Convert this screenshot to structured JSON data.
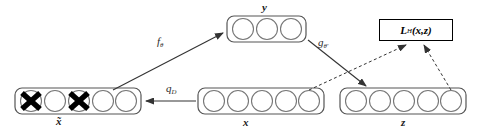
{
  "figure": {
    "type": "diagram",
    "colors": {
      "stroke": "#444444",
      "node_fill": "#ffffff",
      "cross": "#000000",
      "arrow": "#333333",
      "loss_border": "#000000",
      "background": "#ffffff"
    }
  },
  "layers": [
    {
      "id": "x-tilde",
      "label": "x̃",
      "label_plain": "x tilde",
      "units": 5,
      "corrupted_units": [
        1,
        3
      ],
      "corruption_marker": "cross",
      "box": {
        "x": 15,
        "y": 88,
        "w": 126,
        "h": 26
      }
    },
    {
      "id": "y",
      "label": "y",
      "label_plain": "y",
      "units": 3,
      "corrupted_units": [],
      "corruption_marker": "none",
      "box": {
        "x": 227,
        "y": 16,
        "w": 79,
        "h": 26
      }
    },
    {
      "id": "x",
      "label": "x",
      "label_plain": "x",
      "units": 5,
      "corrupted_units": [],
      "corruption_marker": "none",
      "box": {
        "x": 198,
        "y": 88,
        "w": 126,
        "h": 26
      }
    },
    {
      "id": "z",
      "label": "z",
      "label_plain": "z",
      "units": 5,
      "corrupted_units": [],
      "corruption_marker": "none",
      "box": {
        "x": 340,
        "y": 88,
        "w": 126,
        "h": 26
      }
    }
  ],
  "loss_node": {
    "id": "loss",
    "symbol": "L",
    "subscript": "H",
    "args": "(x,z)",
    "full_label": "L_H(x,z)"
  },
  "edges": [
    {
      "id": "corruption",
      "from": "x",
      "to": "x-tilde",
      "style": "solid",
      "label_symbol": "q",
      "label_subscript": "D",
      "label_full": "q_D"
    },
    {
      "id": "encode",
      "from": "x-tilde",
      "to": "y",
      "style": "solid",
      "label_symbol": "f",
      "label_subscript": "θ",
      "label_full": "f_θ"
    },
    {
      "id": "decode",
      "from": "y",
      "to": "z",
      "style": "solid",
      "label_symbol": "g",
      "label_subscript": "θ'",
      "label_full": "g_θ'"
    },
    {
      "id": "loss-from-x",
      "from": "x",
      "to": "loss",
      "style": "dashed",
      "label_symbol": "",
      "label_subscript": "",
      "label_full": ""
    },
    {
      "id": "loss-from-z",
      "from": "z",
      "to": "loss",
      "style": "dashed",
      "label_symbol": "",
      "label_subscript": "",
      "label_full": ""
    }
  ]
}
